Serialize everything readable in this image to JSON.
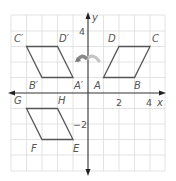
{
  "diagram": {
    "type": "coordinate-plane-transformations",
    "axes": {
      "x_label": "x",
      "y_label": "y",
      "x_ticks": [
        {
          "value": 2,
          "label": "2"
        },
        {
          "value": 4,
          "label": "4"
        }
      ],
      "y_ticks": [
        {
          "value": 4,
          "label": "4"
        },
        {
          "value": -2,
          "label": "−2"
        }
      ],
      "x_range": [
        -5,
        5
      ],
      "y_range": [
        -5,
        5
      ]
    },
    "colors": {
      "grid": "#d9d9d9",
      "axis": "#333333",
      "shape": "#555555",
      "label": "#555555",
      "arrow": "#9a9a9a"
    },
    "figures": [
      {
        "name": "ABCD",
        "vertices": [
          {
            "label": "A",
            "x": 1,
            "y": 1
          },
          {
            "label": "B",
            "x": 3,
            "y": 1
          },
          {
            "label": "C",
            "x": 4,
            "y": 3
          },
          {
            "label": "D",
            "x": 2,
            "y": 3
          }
        ]
      },
      {
        "name": "A'B'C'D'",
        "vertices": [
          {
            "label": "A′",
            "x": -1,
            "y": 1
          },
          {
            "label": "B′",
            "x": -3,
            "y": 1
          },
          {
            "label": "C′",
            "x": -4,
            "y": 3
          },
          {
            "label": "D′",
            "x": -2,
            "y": 3
          }
        ]
      },
      {
        "name": "EFGH",
        "vertices": [
          {
            "label": "E",
            "x": -1,
            "y": -3
          },
          {
            "label": "F",
            "x": -3,
            "y": -3
          },
          {
            "label": "G",
            "x": -4,
            "y": -1
          },
          {
            "label": "H",
            "x": -2,
            "y": -1
          }
        ]
      }
    ],
    "annotations": [
      {
        "type": "curved-arrow",
        "description": "reflection across y-axis, right to left"
      }
    ]
  }
}
